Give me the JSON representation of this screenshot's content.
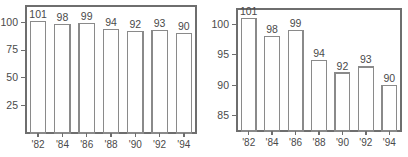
{
  "figure": {
    "background_color": "#ffffff",
    "line_color": "#6e6e6e",
    "bar_face_color": "#ffffff",
    "bar_edge_color": "#8a8a8a",
    "text_color": "#4a4a4a"
  },
  "chart_data": [
    {
      "type": "bar",
      "title": "",
      "subtitle": "",
      "xlabel": "",
      "ylabel": "",
      "categories": [
        "'82",
        "'84",
        "'86",
        "'88",
        "'90",
        "'92",
        "'94"
      ],
      "values": [
        101,
        98,
        99,
        94,
        92,
        93,
        90
      ],
      "data_labels": [
        "101",
        "98",
        "99",
        "94",
        "92",
        "93",
        "90"
      ],
      "ylim": [
        0,
        115
      ],
      "yticks": [
        25,
        50,
        75,
        100
      ],
      "ytick_labels": [
        "25",
        "50",
        "75",
        "100"
      ],
      "xtick_labels": [
        "'82",
        "'84",
        "'86",
        "'88",
        "'90",
        "'92",
        "'94"
      ],
      "grid": false,
      "legend": null,
      "legend_position": "none",
      "bar_fill": "#ffffff",
      "bar_edge": "#8a8a8a"
    },
    {
      "type": "bar",
      "title": "",
      "subtitle": "",
      "xlabel": "",
      "ylabel": "",
      "categories": [
        "'82",
        "'84",
        "'86",
        "'88",
        "'90",
        "'92",
        "'94"
      ],
      "values": [
        101,
        98,
        99,
        94,
        92,
        93,
        90
      ],
      "data_labels": [
        "101",
        "98",
        "99",
        "94",
        "92",
        "93",
        "90"
      ],
      "ylim": [
        82.5,
        102.5
      ],
      "yticks": [
        85,
        90,
        95,
        100
      ],
      "ytick_labels": [
        "85",
        "90",
        "95",
        "100"
      ],
      "xtick_labels": [
        "'82",
        "'84",
        "'86",
        "'88",
        "'90",
        "'92",
        "'94"
      ],
      "grid": false,
      "legend": null,
      "legend_position": "none",
      "bar_fill": "#ffffff",
      "bar_edge": "#8a8a8a"
    }
  ]
}
